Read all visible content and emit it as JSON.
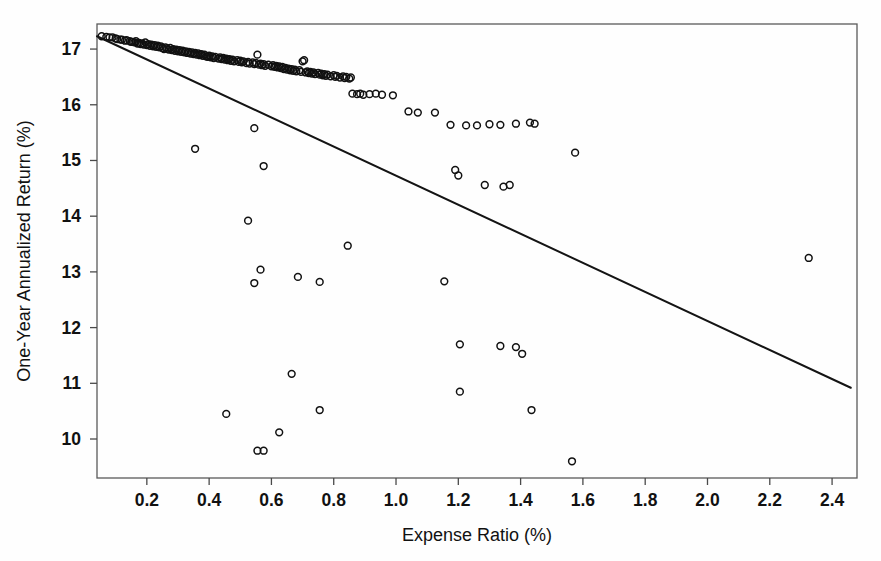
{
  "chart_data": {
    "type": "scatter",
    "title": "",
    "subtitle": "",
    "xlabel": "Expense Ratio (%)",
    "ylabel": "One-Year Annualized Return (%)",
    "xlim": [
      0.04,
      2.48
    ],
    "ylim": [
      9.3,
      17.45
    ],
    "xticks": [
      0.2,
      0.4,
      0.6,
      0.8,
      1.0,
      1.2,
      1.4,
      1.6,
      1.8,
      2.0,
      2.2,
      2.4
    ],
    "xtick_labels": [
      "0.2",
      "0.4",
      "0.6",
      "0.8",
      "1.0",
      "1.2",
      "1.4",
      "1.6",
      "1.8",
      "2.0",
      "2.2",
      "2.4"
    ],
    "yticks": [
      10,
      11,
      12,
      13,
      14,
      15,
      16,
      17
    ],
    "ytick_labels": [
      "10",
      "11",
      "12",
      "13",
      "14",
      "15",
      "16",
      "17"
    ],
    "grid": false,
    "legend": null,
    "marker": "open-circle",
    "marker_color": "#111111",
    "point_radius_px": 3.4,
    "trendline": {
      "type": "linear-fit",
      "color": "#141414",
      "x_start": 0.04,
      "y_start": 17.23,
      "x_end": 2.46,
      "y_end": 10.92,
      "slope": -2.607,
      "intercept": 17.334
    },
    "points": [
      [
        0.055,
        17.23
      ],
      [
        0.07,
        17.22
      ],
      [
        0.08,
        17.21
      ],
      [
        0.09,
        17.21
      ],
      [
        0.1,
        17.19
      ],
      [
        0.105,
        17.18
      ],
      [
        0.115,
        17.17
      ],
      [
        0.12,
        17.17
      ],
      [
        0.13,
        17.15
      ],
      [
        0.135,
        17.16
      ],
      [
        0.145,
        17.14
      ],
      [
        0.15,
        17.13
      ],
      [
        0.155,
        17.13
      ],
      [
        0.16,
        17.12
      ],
      [
        0.165,
        17.14
      ],
      [
        0.17,
        17.1
      ],
      [
        0.175,
        17.11
      ],
      [
        0.18,
        17.09
      ],
      [
        0.185,
        17.1
      ],
      [
        0.19,
        17.08
      ],
      [
        0.195,
        17.12
      ],
      [
        0.2,
        17.07
      ],
      [
        0.205,
        17.09
      ],
      [
        0.21,
        17.06
      ],
      [
        0.215,
        17.08
      ],
      [
        0.22,
        17.05
      ],
      [
        0.225,
        17.07
      ],
      [
        0.23,
        17.04
      ],
      [
        0.235,
        17.06
      ],
      [
        0.24,
        17.03
      ],
      [
        0.245,
        17.05
      ],
      [
        0.25,
        17.02
      ],
      [
        0.255,
        17.0
      ],
      [
        0.26,
        17.03
      ],
      [
        0.265,
        17.01
      ],
      [
        0.27,
        16.99
      ],
      [
        0.275,
        17.02
      ],
      [
        0.28,
        16.98
      ],
      [
        0.285,
        17.0
      ],
      [
        0.29,
        16.97
      ],
      [
        0.295,
        16.99
      ],
      [
        0.3,
        16.96
      ],
      [
        0.305,
        16.98
      ],
      [
        0.31,
        16.95
      ],
      [
        0.315,
        16.97
      ],
      [
        0.32,
        16.94
      ],
      [
        0.325,
        16.96
      ],
      [
        0.33,
        16.93
      ],
      [
        0.335,
        16.95
      ],
      [
        0.34,
        16.92
      ],
      [
        0.345,
        16.94
      ],
      [
        0.35,
        16.91
      ],
      [
        0.355,
        16.93
      ],
      [
        0.36,
        16.9
      ],
      [
        0.365,
        16.92
      ],
      [
        0.37,
        16.89
      ],
      [
        0.375,
        16.91
      ],
      [
        0.38,
        16.88
      ],
      [
        0.385,
        16.9
      ],
      [
        0.39,
        16.87
      ],
      [
        0.395,
        16.86
      ],
      [
        0.4,
        16.88
      ],
      [
        0.405,
        16.85
      ],
      [
        0.41,
        16.87
      ],
      [
        0.415,
        16.84
      ],
      [
        0.42,
        16.86
      ],
      [
        0.43,
        16.83
      ],
      [
        0.435,
        16.85
      ],
      [
        0.44,
        16.82
      ],
      [
        0.445,
        16.84
      ],
      [
        0.45,
        16.81
      ],
      [
        0.455,
        16.83
      ],
      [
        0.46,
        16.8
      ],
      [
        0.465,
        16.82
      ],
      [
        0.47,
        16.79
      ],
      [
        0.475,
        16.81
      ],
      [
        0.48,
        16.78
      ],
      [
        0.49,
        16.8
      ],
      [
        0.495,
        16.77
      ],
      [
        0.5,
        16.79
      ],
      [
        0.505,
        16.76
      ],
      [
        0.51,
        16.78
      ],
      [
        0.52,
        16.75
      ],
      [
        0.525,
        16.77
      ],
      [
        0.53,
        16.74
      ],
      [
        0.54,
        16.76
      ],
      [
        0.545,
        16.73
      ],
      [
        0.55,
        16.75
      ],
      [
        0.555,
        16.9
      ],
      [
        0.56,
        16.72
      ],
      [
        0.565,
        16.74
      ],
      [
        0.57,
        16.71
      ],
      [
        0.575,
        16.73
      ],
      [
        0.58,
        16.7
      ],
      [
        0.59,
        16.72
      ],
      [
        0.6,
        16.69
      ],
      [
        0.605,
        16.71
      ],
      [
        0.61,
        16.68
      ],
      [
        0.615,
        16.7
      ],
      [
        0.62,
        16.67
      ],
      [
        0.625,
        16.69
      ],
      [
        0.63,
        16.66
      ],
      [
        0.635,
        16.68
      ],
      [
        0.64,
        16.64
      ],
      [
        0.645,
        16.66
      ],
      [
        0.65,
        16.63
      ],
      [
        0.655,
        16.65
      ],
      [
        0.66,
        16.62
      ],
      [
        0.665,
        16.64
      ],
      [
        0.67,
        16.61
      ],
      [
        0.675,
        16.63
      ],
      [
        0.68,
        16.6
      ],
      [
        0.69,
        16.62
      ],
      [
        0.695,
        16.59
      ],
      [
        0.7,
        16.78
      ],
      [
        0.705,
        16.8
      ],
      [
        0.71,
        16.58
      ],
      [
        0.715,
        16.6
      ],
      [
        0.72,
        16.57
      ],
      [
        0.725,
        16.59
      ],
      [
        0.73,
        16.56
      ],
      [
        0.735,
        16.58
      ],
      [
        0.74,
        16.55
      ],
      [
        0.75,
        16.57
      ],
      [
        0.755,
        16.54
      ],
      [
        0.76,
        16.56
      ],
      [
        0.765,
        16.53
      ],
      [
        0.77,
        16.55
      ],
      [
        0.775,
        16.52
      ],
      [
        0.78,
        16.54
      ],
      [
        0.79,
        16.51
      ],
      [
        0.8,
        16.53
      ],
      [
        0.805,
        16.5
      ],
      [
        0.81,
        16.52
      ],
      [
        0.82,
        16.49
      ],
      [
        0.83,
        16.51
      ],
      [
        0.835,
        16.48
      ],
      [
        0.84,
        16.5
      ],
      [
        0.85,
        16.47
      ],
      [
        0.855,
        16.49
      ],
      [
        0.86,
        16.2
      ],
      [
        0.875,
        16.19
      ],
      [
        0.885,
        16.2
      ],
      [
        0.895,
        16.18
      ],
      [
        0.915,
        16.19
      ],
      [
        0.935,
        16.2
      ],
      [
        0.955,
        16.18
      ],
      [
        0.99,
        16.17
      ],
      [
        1.04,
        15.88
      ],
      [
        1.07,
        15.86
      ],
      [
        1.125,
        15.86
      ],
      [
        1.175,
        15.64
      ],
      [
        1.225,
        15.63
      ],
      [
        1.26,
        15.63
      ],
      [
        1.3,
        15.65
      ],
      [
        1.335,
        15.64
      ],
      [
        1.385,
        15.66
      ],
      [
        1.43,
        15.68
      ],
      [
        1.445,
        15.66
      ],
      [
        0.355,
        15.21
      ],
      [
        0.545,
        15.58
      ],
      [
        0.575,
        14.9
      ],
      [
        1.19,
        14.83
      ],
      [
        1.2,
        14.73
      ],
      [
        1.285,
        14.56
      ],
      [
        1.345,
        14.53
      ],
      [
        1.365,
        14.56
      ],
      [
        1.575,
        15.14
      ],
      [
        0.525,
        13.92
      ],
      [
        0.845,
        13.47
      ],
      [
        2.325,
        13.25
      ],
      [
        0.565,
        13.04
      ],
      [
        0.685,
        12.91
      ],
      [
        0.545,
        12.8
      ],
      [
        0.755,
        12.82
      ],
      [
        1.155,
        12.83
      ],
      [
        0.665,
        11.17
      ],
      [
        1.205,
        11.7
      ],
      [
        1.335,
        11.67
      ],
      [
        1.385,
        11.65
      ],
      [
        1.405,
        11.53
      ],
      [
        1.205,
        10.85
      ],
      [
        0.455,
        10.45
      ],
      [
        0.755,
        10.52
      ],
      [
        1.435,
        10.52
      ],
      [
        0.625,
        10.12
      ],
      [
        0.555,
        9.79
      ],
      [
        0.575,
        9.79
      ],
      [
        1.565,
        9.6
      ]
    ]
  },
  "axes": {
    "x_title": "Expense Ratio (%)",
    "y_title": "One-Year Annualized Return (%)"
  }
}
